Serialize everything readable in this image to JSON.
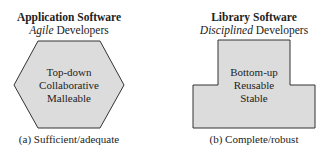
{
  "panels": [
    {
      "title": "Application Software",
      "subtitle_emph": "Agile",
      "subtitle_rest": " Developers",
      "lines": [
        "Top-down",
        "Collaborative",
        "Malleable"
      ],
      "caption": "(a) Sufficient/adequate",
      "shape": "hexagon"
    },
    {
      "title": "Library Software",
      "subtitle_emph": "Disciplined",
      "subtitle_rest": " Developers",
      "lines": [
        "Bottom-up",
        "Reusable",
        "Stable"
      ],
      "caption": "(b) Complete/robust",
      "shape": "t-shape"
    }
  ],
  "colors": {
    "fill": "#dcdcdc",
    "stroke": "#333333"
  }
}
